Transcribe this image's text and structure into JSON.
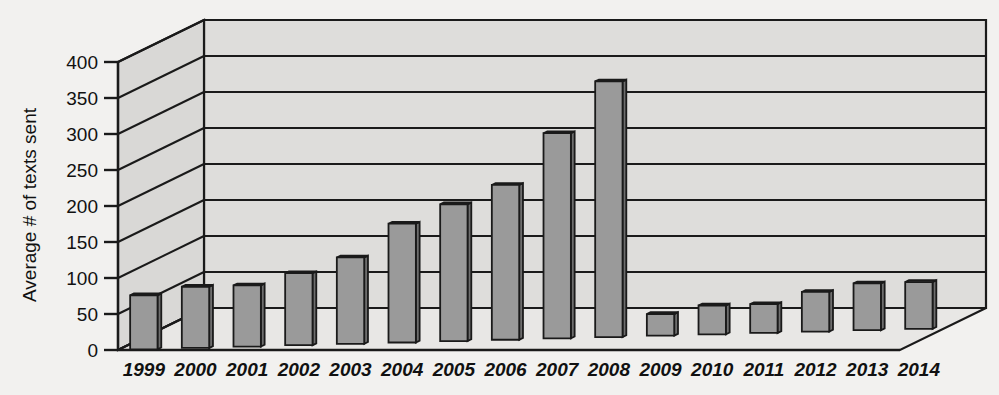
{
  "chart_data": {
    "type": "bar",
    "title": "",
    "subtitle": "",
    "xlabel": "",
    "ylabel": "Average # of texts sent",
    "ylim": [
      0,
      400
    ],
    "ytick_step": 50,
    "yticks": [
      0,
      50,
      100,
      150,
      200,
      250,
      300,
      350,
      400
    ],
    "grid": true,
    "legend": null,
    "style": "3d-bar",
    "categories": [
      "1999",
      "2000",
      "2001",
      "2002",
      "2003",
      "2004",
      "2005",
      "2006",
      "2007",
      "2008",
      "2009",
      "2010",
      "2011",
      "2012",
      "2013",
      "2014"
    ],
    "values": [
      75,
      85,
      85,
      100,
      120,
      165,
      190,
      215,
      285,
      355,
      30,
      40,
      40,
      55,
      65,
      65
    ],
    "series": [
      {
        "name": "Average # of texts sent",
        "values": [
          75,
          85,
          85,
          100,
          120,
          165,
          190,
          215,
          285,
          355,
          30,
          40,
          40,
          55,
          65,
          65
        ]
      }
    ],
    "annotations": []
  },
  "colors": {
    "page_background": "#f2f1ef",
    "wall_fill": "#dedddb",
    "floor_fill": "#e8e7e5",
    "side_wall_fill": "#d9d8d6",
    "bar_front": "#9a9a9a",
    "bar_top": "#b4b4b4",
    "bar_side": "#6e6e6e",
    "line": "#1a1a1a",
    "text": "#111111"
  },
  "axis": {
    "y_label": "Average # of texts sent",
    "y_tick_labels": [
      "400",
      "350",
      "300",
      "250",
      "200",
      "150",
      "100",
      "50",
      "0"
    ],
    "x_tick_labels": [
      "1999",
      "2000",
      "2001",
      "2002",
      "2003",
      "2004",
      "2005",
      "2006",
      "2007",
      "2008",
      "2009",
      "2010",
      "2011",
      "2012",
      "2013",
      "2014"
    ]
  }
}
